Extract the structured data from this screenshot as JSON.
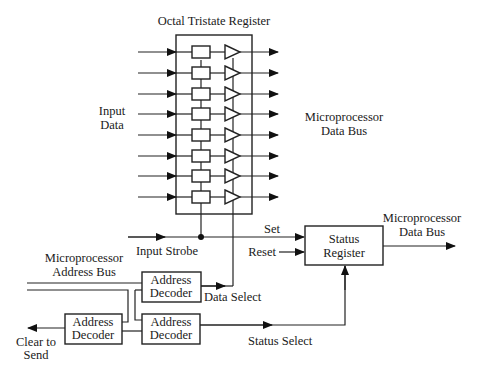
{
  "diagram": {
    "title": "Octal Tristate Register",
    "input_data_label": [
      "Input",
      "Data"
    ],
    "data_bus_label": [
      "Microprocessor",
      "Data Bus"
    ],
    "input_strobe_label": "Input Strobe",
    "set_label": "Set",
    "reset_label": "Reset",
    "status_register_label": [
      "Status",
      "Register"
    ],
    "status_data_bus_label": [
      "Microprocessor",
      "Data Bus"
    ],
    "address_bus_label": [
      "Microprocessor",
      "Address Bus"
    ],
    "decoder_top_label": [
      "Address",
      "Decoder"
    ],
    "decoder_bottom_label": [
      "Address",
      "Decoder"
    ],
    "decoder_left_label": [
      "Address",
      "Decoder"
    ],
    "data_select_label": "Data Select",
    "status_select_label": "Status Select",
    "clear_to_send_label": [
      "Clear to",
      "Send"
    ],
    "register_rows": 8,
    "line_color": "#222222"
  }
}
